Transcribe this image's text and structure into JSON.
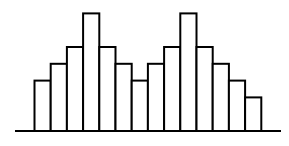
{
  "chart_data": {
    "type": "bar",
    "title": "",
    "xlabel": "",
    "ylabel": "",
    "categories": [
      "1",
      "2",
      "3",
      "4",
      "5",
      "6",
      "7",
      "8",
      "9",
      "10",
      "11",
      "12",
      "13",
      "14"
    ],
    "values": [
      3,
      4,
      5,
      7,
      5,
      4,
      3,
      4,
      5,
      7,
      5,
      4,
      3,
      2
    ],
    "ylim": [
      0,
      7
    ],
    "grid": false,
    "legend": null,
    "bar_fill": "#ffffff",
    "bar_stroke": "#000000"
  }
}
